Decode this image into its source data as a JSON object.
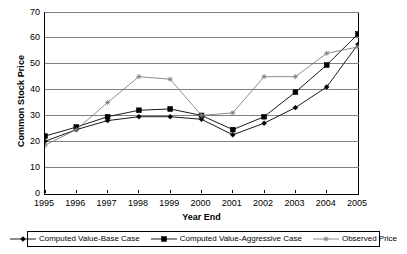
{
  "chart_data": {
    "type": "line",
    "title": "",
    "xlabel": "Year End",
    "ylabel": "Common Stock Price",
    "x": [
      1995,
      1996,
      1997,
      1998,
      1999,
      2000,
      2001,
      2002,
      2003,
      2004,
      2005
    ],
    "xticklabels": [
      "1995",
      "1996",
      "1997",
      "1998",
      "1999",
      "2000",
      "2001",
      "2002",
      "2003",
      "2004",
      "2005"
    ],
    "yticklabels": [
      "0",
      "10",
      "20",
      "30",
      "40",
      "50",
      "60",
      "70"
    ],
    "yticks": [
      0,
      10,
      20,
      30,
      40,
      50,
      60,
      70
    ],
    "ylim": [
      0,
      70
    ],
    "xlim": [
      1995,
      2005
    ],
    "grid": "horizontal",
    "legend_position": "bottom",
    "series": [
      {
        "name": "Computed Value-Base Case",
        "marker": "diamond",
        "color": "#000000",
        "values": [
          20.0,
          24.5,
          28.0,
          29.5,
          29.5,
          28.5,
          22.5,
          27.0,
          33.0,
          41.0,
          57.5
        ]
      },
      {
        "name": "Computed Value-Aggressive Case",
        "marker": "square",
        "color": "#000000",
        "values": [
          22.0,
          25.5,
          29.5,
          32.0,
          32.5,
          30.0,
          24.5,
          29.5,
          39.0,
          49.5,
          61.5
        ]
      },
      {
        "name": "Observed Price",
        "marker": "star",
        "color": "#808080",
        "values": [
          18.5,
          24.5,
          35.0,
          45.0,
          44.0,
          30.0,
          31.0,
          45.0,
          45.0,
          54.0,
          56.5
        ]
      }
    ]
  },
  "legend": {
    "items": [
      {
        "label": "Computed Value-Base Case"
      },
      {
        "label": "Computed Value-Aggressive Case"
      },
      {
        "label": "Observed Price"
      }
    ]
  }
}
